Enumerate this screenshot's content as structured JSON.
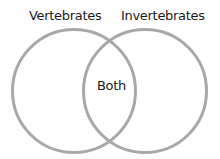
{
  "diagram": {
    "type": "venn",
    "sets": [
      {
        "label": "Vertebrates"
      },
      {
        "label": "Invertebrates"
      }
    ],
    "intersection_label": "Both",
    "stroke_color": "#a8a8a8",
    "text_color": "#1a1a1a"
  }
}
